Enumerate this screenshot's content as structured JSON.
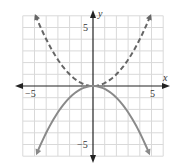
{
  "chart_data": {
    "type": "line",
    "title": "",
    "xlabel": "x",
    "ylabel": "y",
    "xlim": [
      -6,
      6
    ],
    "ylim": [
      -6,
      6
    ],
    "grid": true,
    "legend": null,
    "x_tick_labels": [
      {
        "value": -5,
        "label": "−5"
      },
      {
        "value": 5,
        "label": "5"
      }
    ],
    "y_tick_labels": [
      {
        "value": 5,
        "label": "5"
      },
      {
        "value": -5,
        "label": "−5"
      }
    ],
    "series": [
      {
        "name": "y = x²/4",
        "style": "dashed",
        "color": "#666666",
        "x": [
          -4.9,
          -4,
          -3,
          -2,
          -1,
          0,
          1,
          2,
          3,
          4,
          4.9
        ],
        "y": [
          6.0,
          4.0,
          2.25,
          1.0,
          0.25,
          0,
          0.25,
          1.0,
          2.25,
          4.0,
          6.0
        ]
      },
      {
        "name": "y = −x²/4",
        "style": "solid",
        "color": "#8a8a8a",
        "x": [
          -4.8,
          -4,
          -3,
          -2,
          -1,
          0,
          1,
          2,
          3,
          4,
          4.8
        ],
        "y": [
          -5.76,
          -4.0,
          -2.25,
          -1.0,
          -0.25,
          0,
          -0.25,
          -1.0,
          -2.25,
          -4.0,
          -5.76
        ]
      }
    ]
  },
  "axes": {
    "x_name": "x",
    "y_name": "y",
    "x_neg_label": "−5",
    "x_pos_label": "5",
    "y_pos_label": "5",
    "y_neg_label": "−5"
  },
  "colors": {
    "grid": "#d9d9d9",
    "axis": "#222222",
    "dashed_curve": "#666666",
    "solid_curve": "#8a8a8a"
  }
}
